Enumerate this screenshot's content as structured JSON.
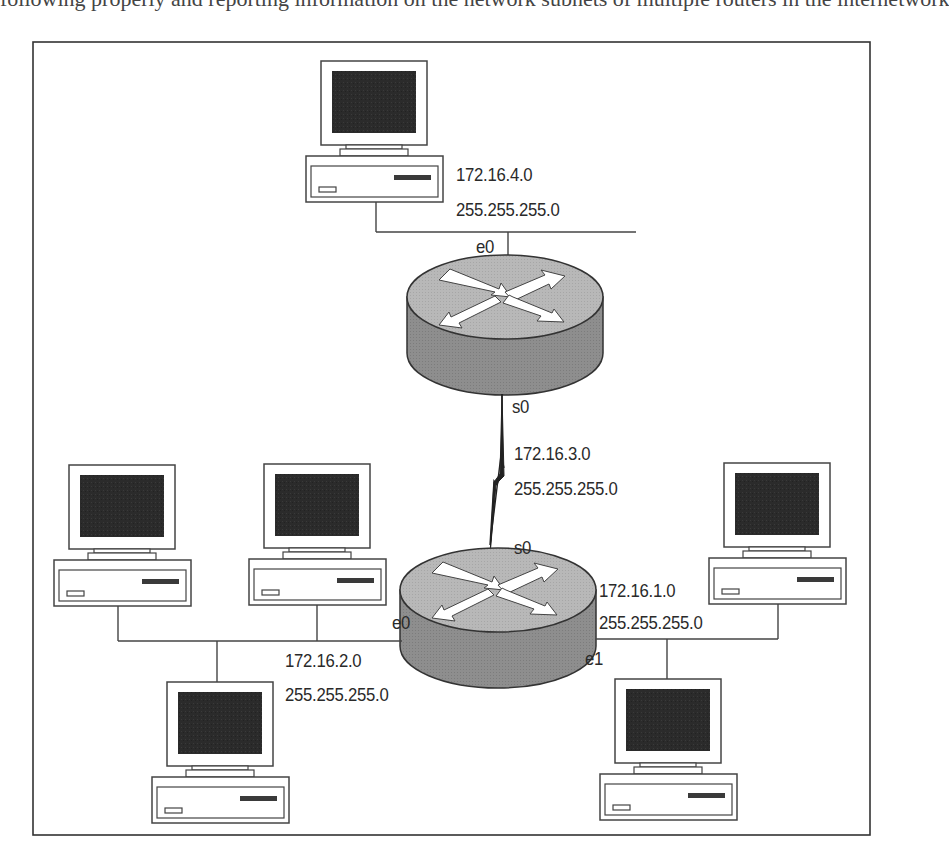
{
  "page": {
    "clipped_header_text": "following properly and reporting information on the network subnets of multiple routers in the internetwork"
  },
  "colors": {
    "frame": "#333333",
    "line": "#444444",
    "screen": "#2b2b2b",
    "router_top": "#b9b9b9",
    "router_side": "#8f8f8f",
    "text": "#2a2a2a"
  },
  "diagram": {
    "title": "",
    "routers": [
      {
        "id": "router-top",
        "interfaces": {
          "e0": "e0",
          "s0": "s0"
        }
      },
      {
        "id": "router-bottom",
        "interfaces": {
          "s0": "s0",
          "e0": "e0",
          "e1": "e1"
        }
      }
    ],
    "networks": [
      {
        "id": "net-top-lan",
        "address": "172.16.4.0",
        "mask": "255.255.255.0"
      },
      {
        "id": "net-serial",
        "address": "172.16.3.0",
        "mask": "255.255.255.0"
      },
      {
        "id": "net-left-lan",
        "address": "172.16.2.0",
        "mask": "255.255.255.0"
      },
      {
        "id": "net-right-lan",
        "address": "172.16.1.0",
        "mask": "255.255.255.0"
      }
    ],
    "hosts": [
      {
        "id": "pc-top",
        "network": "172.16.4.0"
      },
      {
        "id": "pc-left-1",
        "network": "172.16.2.0"
      },
      {
        "id": "pc-left-2",
        "network": "172.16.2.0"
      },
      {
        "id": "pc-left-3",
        "network": "172.16.2.0"
      },
      {
        "id": "pc-right-1",
        "network": "172.16.1.0"
      },
      {
        "id": "pc-right-2",
        "network": "172.16.1.0"
      }
    ],
    "links": [
      {
        "from": "pc-top",
        "to": "router-top",
        "iface": "e0"
      },
      {
        "from": "router-top",
        "to": "router-bottom",
        "type": "serial",
        "iface_a": "s0",
        "iface_b": "s0"
      },
      {
        "from": "router-bottom",
        "to": "net-left-lan",
        "iface": "e0"
      },
      {
        "from": "router-bottom",
        "to": "net-right-lan",
        "iface": "e1"
      }
    ]
  },
  "labels": {
    "top_net_addr": "172.16.4.0",
    "top_net_mask": "255.255.255.0",
    "top_router_e0": "e0",
    "top_router_s0": "s0",
    "serial_net_addr": "172.16.3.0",
    "serial_net_mask": "255.255.255.0",
    "bottom_router_s0": "s0",
    "bottom_router_e0": "e0",
    "bottom_router_e1": "e1",
    "right_net_addr": "172.16.1.0",
    "right_net_mask": "255.255.255.0",
    "left_net_addr": "172.16.2.0",
    "left_net_mask": "255.255.255.0"
  }
}
